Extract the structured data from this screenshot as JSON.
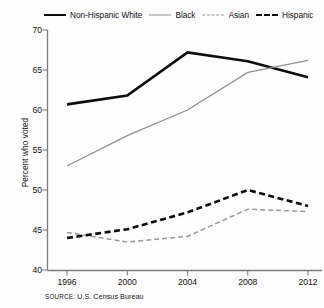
{
  "chart_data": {
    "type": "line",
    "title": "",
    "subtitle": "",
    "xlabel": "",
    "ylabel": "Percent who voted",
    "categories": [
      "1996",
      "2000",
      "2004",
      "2008",
      "2012"
    ],
    "x": [
      1996,
      2000,
      2004,
      2008,
      2012
    ],
    "xlim": [
      1994,
      2014
    ],
    "ylim": [
      40,
      70
    ],
    "yticks": [
      40,
      45,
      50,
      55,
      60,
      65,
      70
    ],
    "xticks": [
      1996,
      2000,
      2004,
      2008,
      2012
    ],
    "grid": false,
    "legend_position": "top",
    "series": [
      {
        "name": "Non-Hispanic White",
        "style": "solid-thick",
        "color": "#0d0d0d",
        "values": [
          60.7,
          61.8,
          67.2,
          66.1,
          64.1
        ]
      },
      {
        "name": "Black",
        "style": "solid-thin",
        "color": "#909090",
        "values": [
          53.0,
          56.8,
          60.0,
          64.7,
          66.2
        ]
      },
      {
        "name": "Asian",
        "style": "dashed-thin",
        "color": "#9a9a9a",
        "values": [
          44.7,
          43.5,
          44.2,
          47.6,
          47.3
        ]
      },
      {
        "name": "Hispanic",
        "style": "dashed-thick",
        "color": "#0d0d0d",
        "values": [
          44.0,
          45.1,
          47.2,
          50.0,
          48.0
        ]
      }
    ],
    "source": "SOURCE: U.S. Census Bureau"
  },
  "legend": {
    "items": [
      {
        "label": "Non-Hispanic White",
        "swatch": "solid-thick-black-swatch"
      },
      {
        "label": "Black",
        "swatch": "solid-thin-gray-swatch"
      },
      {
        "label": "Asian",
        "swatch": "dashed-thin-gray-swatch"
      },
      {
        "label": "Hispanic",
        "swatch": "dashed-thick-black-swatch"
      }
    ]
  },
  "axes": {
    "y_title": "Percent who voted",
    "y_tick_labels": [
      "70",
      "65",
      "60",
      "55",
      "50",
      "45",
      "40"
    ],
    "x_tick_labels": [
      "1996",
      "2000",
      "2004",
      "2008",
      "2012"
    ]
  },
  "source": {
    "prefix": "SOURCE:",
    "text": " U.S. Census Bureau",
    "full": "SOURCE: U.S. Census Bureau"
  },
  "colors": {
    "axis": "#7d7d7d",
    "text": "#111111",
    "white_series": "#0d0d0d",
    "black_series": "#909090",
    "asian_series": "#9a9a9a",
    "hispanic_series": "#0d0d0d",
    "background": "#fdfdfd"
  }
}
